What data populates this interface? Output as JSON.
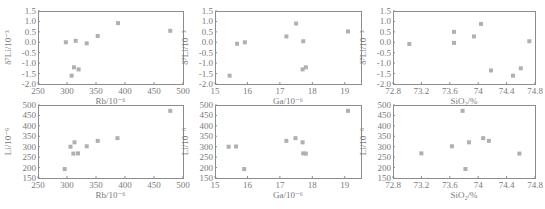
{
  "figure": {
    "width": 545,
    "height": 209,
    "marker_color": "#b0b0b0",
    "axis_color": "#8c8c8c",
    "text_color": "#7a7a7a"
  },
  "chart_data": [
    {
      "id": "d7li-rb",
      "type": "scatter",
      "title": "",
      "xlabel": "Rb/10⁻⁶",
      "ylabel": "δ⁷Li/10⁻³",
      "xlim": [
        250,
        500
      ],
      "ylim": [
        -2.0,
        1.5
      ],
      "xticks": [
        250,
        300,
        350,
        400,
        450,
        500
      ],
      "xtick_labels": [
        "250",
        "300",
        "350",
        "400",
        "450",
        "500"
      ],
      "yticks": [
        -2.0,
        -1.5,
        -1.0,
        -0.5,
        0.0,
        0.5,
        1.0,
        1.5
      ],
      "ytick_labels": [
        "-2.0",
        "-1.5",
        "-1.0",
        "-0.5",
        "0.0",
        "0.5",
        "1.0",
        "1.5"
      ],
      "grid": false,
      "x": [
        298,
        315,
        334,
        353,
        388,
        478,
        312,
        320,
        308
      ],
      "y": [
        0.0,
        0.07,
        -0.05,
        0.3,
        0.92,
        0.55,
        -1.2,
        -1.3,
        -1.6
      ],
      "frame": {
        "left": 38,
        "top": 11,
        "right": 183,
        "bottom": 84
      }
    },
    {
      "id": "d7li-ga",
      "type": "scatter",
      "title": "",
      "xlabel": "Ga/10⁻⁶",
      "ylabel": "δ⁷Li/10⁻³",
      "xlim": [
        15,
        19.5
      ],
      "ylim": [
        -2.0,
        1.5
      ],
      "xticks": [
        15,
        16,
        17,
        18,
        19
      ],
      "xtick_labels": [
        "15",
        "16",
        "17",
        "18",
        "19"
      ],
      "yticks": [
        -2.0,
        -1.5,
        -1.0,
        -0.5,
        0.0,
        0.5,
        1.0,
        1.5
      ],
      "ytick_labels": [
        "-2.0",
        "-1.5",
        "-1.0",
        "-0.5",
        "0.0",
        "0.5",
        "1.0",
        "1.5"
      ],
      "grid": false,
      "x": [
        15.45,
        15.68,
        15.92,
        17.2,
        17.5,
        17.72,
        17.7,
        17.8,
        19.1
      ],
      "y": [
        -1.6,
        -0.07,
        0.0,
        0.28,
        0.9,
        0.05,
        -1.3,
        -1.2,
        0.52
      ],
      "frame": {
        "left": 215,
        "top": 11,
        "right": 361,
        "bottom": 84
      }
    },
    {
      "id": "d7li-sio2",
      "type": "scatter",
      "title": "",
      "xlabel": "SiO₂/%",
      "ylabel": "δ⁷Li/10⁻³",
      "xlim": [
        72.8,
        74.8
      ],
      "ylim": [
        -2.0,
        1.5
      ],
      "xticks": [
        72.8,
        73.2,
        73.6,
        74.0,
        74.4,
        74.8
      ],
      "xtick_labels": [
        "72.8",
        "73.2",
        "73.6",
        "74",
        "74.4",
        "74.8"
      ],
      "yticks": [
        -2.0,
        -1.5,
        -1.0,
        -0.5,
        0.0,
        0.5,
        1.0,
        1.5
      ],
      "ytick_labels": [
        "-2.0",
        "-1.5",
        "-1.0",
        "-0.5",
        "0.0",
        "0.5",
        "1.0",
        "1.5"
      ],
      "grid": false,
      "x": [
        73.03,
        73.66,
        73.66,
        73.94,
        74.04,
        74.18,
        74.49,
        74.6,
        74.72
      ],
      "y": [
        -0.08,
        0.5,
        -0.03,
        0.28,
        0.88,
        -1.35,
        -1.6,
        -1.25,
        0.05
      ],
      "frame": {
        "left": 393,
        "top": 11,
        "right": 535,
        "bottom": 84
      }
    },
    {
      "id": "li-rb",
      "type": "scatter",
      "title": "",
      "xlabel": "Rb/10⁻⁶",
      "ylabel": "Li/10⁻⁶",
      "xlim": [
        250,
        500
      ],
      "ylim": [
        150,
        500
      ],
      "xticks": [
        250,
        300,
        350,
        400,
        450,
        500
      ],
      "xtick_labels": [
        "250",
        "300",
        "350",
        "400",
        "450",
        "500"
      ],
      "yticks": [
        150,
        200,
        250,
        300,
        350,
        400,
        450,
        500
      ],
      "ytick_labels": [
        "150",
        "200",
        "250",
        "300",
        "350",
        "400",
        "450",
        "500"
      ],
      "grid": false,
      "x": [
        296,
        306,
        313,
        311,
        319,
        334,
        353,
        387,
        478
      ],
      "y": [
        193,
        300,
        321,
        267,
        268,
        302,
        328,
        341,
        472
      ],
      "frame": {
        "left": 38,
        "top": 105,
        "right": 183,
        "bottom": 178
      }
    },
    {
      "id": "li-ga",
      "type": "scatter",
      "title": "",
      "xlabel": "Ga/10⁻⁶",
      "ylabel": "Li/10⁻⁶",
      "xlim": [
        15,
        19.5
      ],
      "ylim": [
        150,
        500
      ],
      "xticks": [
        15,
        16,
        17,
        18,
        19
      ],
      "xtick_labels": [
        "15",
        "16",
        "17",
        "18",
        "19"
      ],
      "yticks": [
        150,
        200,
        250,
        300,
        350,
        400,
        450,
        500
      ],
      "ytick_labels": [
        "150",
        "200",
        "250",
        "300",
        "350",
        "400",
        "450",
        "500"
      ],
      "grid": false,
      "x": [
        15.42,
        15.65,
        15.9,
        17.2,
        17.48,
        17.7,
        17.72,
        17.8,
        19.1
      ],
      "y": [
        300,
        301,
        193,
        328,
        341,
        321,
        268,
        267,
        472
      ],
      "frame": {
        "left": 215,
        "top": 105,
        "right": 361,
        "bottom": 178
      }
    },
    {
      "id": "li-sio2",
      "type": "scatter",
      "title": "",
      "xlabel": "SiO₂/%",
      "ylabel": "Li/10⁻⁶",
      "xlim": [
        72.8,
        74.8
      ],
      "ylim": [
        150,
        500
      ],
      "xticks": [
        72.8,
        73.2,
        73.6,
        74.0,
        74.4,
        74.8
      ],
      "xtick_labels": [
        "72.8",
        "73.2",
        "73.6",
        "74",
        "74.4",
        "74.8"
      ],
      "yticks": [
        150,
        200,
        250,
        300,
        350,
        400,
        450,
        500
      ],
      "ytick_labels": [
        "150",
        "200",
        "250",
        "300",
        "350",
        "400",
        "450",
        "500"
      ],
      "grid": false,
      "x": [
        73.2,
        73.63,
        73.78,
        73.82,
        73.87,
        74.07,
        74.15,
        74.58
      ],
      "y": [
        268,
        302,
        472,
        193,
        321,
        341,
        328,
        267
      ],
      "frame": {
        "left": 393,
        "top": 105,
        "right": 535,
        "bottom": 178
      }
    }
  ]
}
